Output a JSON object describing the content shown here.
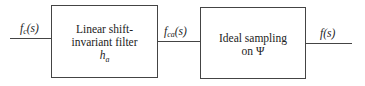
{
  "diagram": {
    "input_signal": {
      "base": "f",
      "sub": "c",
      "arg": "(s)"
    },
    "filter_block": {
      "line1": "Linear shift-",
      "line2": "invariant filter",
      "symbol_base": "h",
      "symbol_sub": "a"
    },
    "intermediate_signal": {
      "base": "f",
      "sub": "ca",
      "arg": "(s)"
    },
    "sampling_block": {
      "line1": "Ideal sampling",
      "line2": "on Ψ"
    },
    "output_signal": {
      "text": "f(s)"
    }
  }
}
